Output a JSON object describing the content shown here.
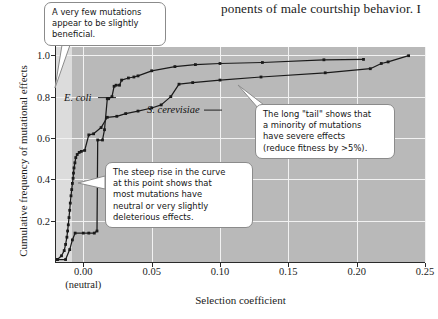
{
  "page": {
    "body_text_fragment": "ponents of male courtship behavior. I"
  },
  "figure": {
    "axis_title_x": "Selection coefficient",
    "axis_title_y": "Cumulative frequency of mutational effects",
    "series_labels": {
      "ecoli": "E. coli",
      "scerevisiae": "S. cerevisiae"
    },
    "x_tick_labels": [
      "0.00",
      "0.05",
      "0.10",
      "0.15",
      "0.20",
      "0.25"
    ],
    "x_tick_sublabel": "(neutral)",
    "y_tick_labels": [
      "0.2",
      "0.4",
      "0.6",
      "0.8",
      "1.0"
    ]
  },
  "callouts": {
    "beneficial": {
      "name": "callout-beneficial",
      "lines": [
        "A very few mutations",
        "appear to be slightly",
        "beneficial."
      ]
    },
    "steep_rise": {
      "name": "callout-steep-rise",
      "lines": [
        "The steep rise in the curve",
        "at this point shows that",
        "most mutations have",
        "neutral or very slightly",
        "deleterious effects."
      ]
    },
    "long_tail": {
      "name": "callout-long-tail",
      "lines": [
        "The long \"tail\" shows that",
        "a minority of mutations",
        "have severe effects",
        "(reduce fitness by >5%)."
      ]
    }
  },
  "colors": {
    "plot_band_dark": "#b9b9b9",
    "plot_band_light": "#dcdcdc",
    "gridline": "#f2f2f2",
    "axis": "#2a2a2a",
    "curve": "#1a1a1a",
    "callout_border": "#8b8b8b",
    "callout_fill": "#ffffff"
  },
  "chart_data": {
    "type": "line",
    "title": "",
    "xlabel": "Selection coefficient",
    "ylabel": "Cumulative frequency of mutational effects",
    "xlim": [
      -0.02,
      0.25
    ],
    "ylim": [
      0.0,
      1.04
    ],
    "xticks": [
      0.0,
      0.05,
      0.1,
      0.15,
      0.2,
      0.25
    ],
    "yticks": [
      0.2,
      0.4,
      0.6,
      0.8,
      1.0
    ],
    "grid": true,
    "legend": "inline-labels",
    "annotations": [
      "A very few mutations appear to be slightly beneficial.",
      "The steep rise in the curve at this point shows that most mutations have neutral or very slightly deleterious effects.",
      "The long \"tail\" shows that a minority of mutations have severe effects (reduce fitness by >5%)."
    ],
    "series": [
      {
        "name": "E. coli",
        "marker": "square",
        "points": [
          [
            -0.019,
            0.012
          ],
          [
            -0.013,
            0.012
          ],
          [
            -0.01,
            0.06
          ],
          [
            -0.008,
            0.107
          ],
          [
            -0.006,
            0.14
          ],
          [
            0.0,
            0.14
          ],
          [
            0.004,
            0.14
          ],
          [
            0.008,
            0.14
          ],
          [
            0.01,
            0.15
          ],
          [
            0.0105,
            0.59
          ],
          [
            0.014,
            0.59
          ],
          [
            0.0155,
            0.64
          ],
          [
            0.0175,
            0.79
          ],
          [
            0.0185,
            0.79
          ],
          [
            0.021,
            0.8
          ],
          [
            0.0225,
            0.85
          ],
          [
            0.024,
            0.855
          ],
          [
            0.0265,
            0.855
          ],
          [
            0.028,
            0.88
          ],
          [
            0.033,
            0.89
          ],
          [
            0.037,
            0.895
          ],
          [
            0.04,
            0.9
          ],
          [
            0.05,
            0.925
          ],
          [
            0.067,
            0.945
          ],
          [
            0.082,
            0.955
          ],
          [
            0.1,
            0.96
          ],
          [
            0.131,
            0.965
          ],
          [
            0.176,
            0.978
          ],
          [
            0.205,
            0.98
          ]
        ]
      },
      {
        "name": "S. cerevisiae",
        "marker": "square",
        "points": [
          [
            -0.019,
            0.012
          ],
          [
            -0.016,
            0.03
          ],
          [
            -0.014,
            0.055
          ],
          [
            -0.013,
            0.085
          ],
          [
            -0.012,
            0.12
          ],
          [
            -0.0115,
            0.15
          ],
          [
            -0.011,
            0.18
          ],
          [
            -0.0105,
            0.215
          ],
          [
            -0.01,
            0.25
          ],
          [
            -0.0095,
            0.285
          ],
          [
            -0.009,
            0.32
          ],
          [
            -0.0085,
            0.35
          ],
          [
            -0.008,
            0.38
          ],
          [
            -0.0075,
            0.405
          ],
          [
            -0.0072,
            0.43
          ],
          [
            -0.0068,
            0.455
          ],
          [
            -0.0062,
            0.48
          ],
          [
            -0.0055,
            0.505
          ],
          [
            -0.0045,
            0.52
          ],
          [
            -0.003,
            0.53
          ],
          [
            -0.0015,
            0.535
          ],
          [
            0.001,
            0.54
          ],
          [
            0.004,
            0.615
          ],
          [
            0.0075,
            0.62
          ],
          [
            0.013,
            0.65
          ],
          [
            0.0175,
            0.7
          ],
          [
            0.0245,
            0.705
          ],
          [
            0.031,
            0.718
          ],
          [
            0.04,
            0.73
          ],
          [
            0.05,
            0.745
          ],
          [
            0.057,
            0.76
          ],
          [
            0.064,
            0.8
          ],
          [
            0.07,
            0.86
          ],
          [
            0.08,
            0.868
          ],
          [
            0.1,
            0.88
          ],
          [
            0.13,
            0.895
          ],
          [
            0.177,
            0.915
          ],
          [
            0.21,
            0.935
          ],
          [
            0.218,
            0.96
          ],
          [
            0.223,
            0.968
          ],
          [
            0.238,
            0.998
          ]
        ]
      }
    ]
  }
}
